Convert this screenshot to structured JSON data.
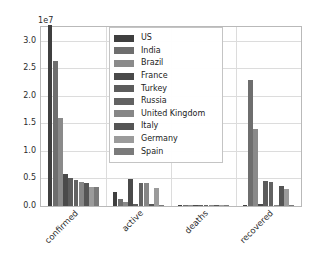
{
  "chart": {
    "type": "bar",
    "exponent_label": "1e7",
    "title": "",
    "xlabel": "",
    "ylabel": "",
    "grid": true,
    "legend_position": "upper center"
  },
  "axes": {
    "yticks": [
      "0.0",
      "0.5",
      "1.0",
      "1.5",
      "2.0",
      "2.5",
      "3.0"
    ],
    "ytick_values": [
      0,
      5000000,
      10000000,
      15000000,
      20000000,
      25000000,
      30000000
    ],
    "ylim": [
      0,
      32500000
    ],
    "xticks": [
      "confirmed",
      "active",
      "deaths",
      "recovered"
    ]
  },
  "legend": {
    "entries": [
      {
        "label": "US",
        "color": "#3f3f3f"
      },
      {
        "label": "India",
        "color": "#6e6e6e"
      },
      {
        "label": "Brazil",
        "color": "#8a8a8a"
      },
      {
        "label": "France",
        "color": "#4a4a4a"
      },
      {
        "label": "Turkey",
        "color": "#5c5c5c"
      },
      {
        "label": "Russia",
        "color": "#626262"
      },
      {
        "label": "United Kingdom",
        "color": "#868686"
      },
      {
        "label": "Italy",
        "color": "#555555"
      },
      {
        "label": "Germany",
        "color": "#9b9b9b"
      },
      {
        "label": "Spain",
        "color": "#7a7a7a"
      }
    ]
  },
  "chart_data": {
    "type": "bar",
    "title": "",
    "xlabel": "",
    "ylabel": "",
    "ylim": [
      0,
      32500000
    ],
    "grid": true,
    "legend_position": "upper center",
    "exponent": "1e7",
    "categories": [
      "confirmed",
      "active",
      "deaths",
      "recovered"
    ],
    "series": [
      {
        "name": "US",
        "color": "#3f3f3f",
        "values": [
          32900000,
          2600000,
          160000,
          100000
        ]
      },
      {
        "name": "India",
        "color": "#6e6e6e",
        "values": [
          26300000,
          1300000,
          150000,
          22900000
        ]
      },
      {
        "name": "Brazil",
        "color": "#8a8a8a",
        "values": [
          15900000,
          800000,
          150000,
          13900000
        ]
      },
      {
        "name": "France",
        "color": "#4a4a4a",
        "values": [
          5800000,
          4900000,
          106000,
          300000
        ]
      },
      {
        "name": "Turkey",
        "color": "#5c5c5c",
        "values": [
          5000000,
          300000,
          43000,
          4600000
        ]
      },
      {
        "name": "Russia",
        "color": "#626262",
        "values": [
          4800000,
          4100000,
          110000,
          4400000
        ]
      },
      {
        "name": "United Kingdom",
        "color": "#868686",
        "values": [
          4430000,
          4200000,
          127000,
          20000
        ]
      },
      {
        "name": "Italy",
        "color": "#555555",
        "values": [
          4100000,
          400000,
          123000,
          3600000
        ]
      },
      {
        "name": "Germany",
        "color": "#9b9b9b",
        "values": [
          3450000,
          3200000,
          84000,
          3100000
        ]
      },
      {
        "name": "Spain",
        "color": "#7a7a7a",
        "values": [
          3450000,
          200000,
          78000,
          150000
        ]
      }
    ]
  }
}
